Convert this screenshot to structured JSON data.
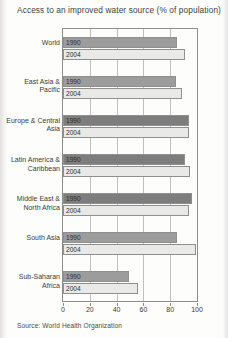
{
  "title": "Access to an improved water source (% of population)",
  "source": "Source: World Health Organization",
  "colors": {
    "series_1990": "#9c9c9c",
    "series_2004": "#e9e9e7",
    "series_1990_dark": "#7d7d7d",
    "axis": "#8d8d8d",
    "grid": "#bfbfbf"
  },
  "chart_data": {
    "type": "bar",
    "orientation": "horizontal",
    "title": "Access to an improved water source (% of population)",
    "xlabel": "",
    "ylabel": "",
    "xlim": [
      0,
      100
    ],
    "xticks": [
      0,
      20,
      40,
      60,
      80,
      100
    ],
    "grid": true,
    "legend": "inline-bar-labels",
    "categories": [
      "World",
      "East Asia & Pacific",
      "Europe & Central Asia",
      "Latin America & Caribbean",
      "Middle East & North Africa",
      "South Asia",
      "Sub-Saharan Africa"
    ],
    "series": [
      {
        "name": "1990",
        "values": [
          85,
          84,
          94,
          91,
          96,
          85,
          49
        ]
      },
      {
        "name": "2004",
        "values": [
          91,
          89,
          94,
          95,
          94,
          99,
          56
        ]
      }
    ]
  }
}
